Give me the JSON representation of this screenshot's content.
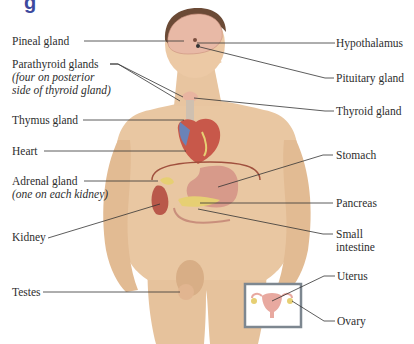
{
  "title_fragment": "g",
  "labels_left": [
    {
      "id": "pineal",
      "text": "Pineal gland",
      "note": ""
    },
    {
      "id": "parathyroid",
      "text": "Parathyroid glands",
      "note_line1": "(four on posterior",
      "note_line2": "side of thyroid gland)"
    },
    {
      "id": "thymus",
      "text": "Thymus gland",
      "note": ""
    },
    {
      "id": "heart",
      "text": "Heart",
      "note": ""
    },
    {
      "id": "adrenal",
      "text": "Adrenal gland",
      "note": "(one on each kidney)"
    },
    {
      "id": "kidney",
      "text": "Kidney",
      "note": ""
    },
    {
      "id": "testes",
      "text": "Testes",
      "note": ""
    }
  ],
  "labels_right": [
    {
      "id": "hypothalamus",
      "text": "Hypothalamus"
    },
    {
      "id": "pituitary",
      "text": "Pituitary gland"
    },
    {
      "id": "thyroid",
      "text": "Thyroid gland"
    },
    {
      "id": "stomach",
      "text": "Stomach"
    },
    {
      "id": "pancreas",
      "text": "Pancreas"
    },
    {
      "id": "small_intestine",
      "text_line1": "Small",
      "text_line2": "intestine"
    },
    {
      "id": "uterus",
      "text": "Uterus"
    },
    {
      "id": "ovary",
      "text": "Ovary"
    }
  ],
  "colors": {
    "skin": "#e9c7a2",
    "skin_shadow": "#d4a880",
    "hair": "#6b4a36",
    "brain": "#e8b9a6",
    "heart": "#c8584a",
    "vessel_blue": "#6a83b8",
    "stomach": "#d79a8a",
    "kidney": "#b9584a",
    "gland_yellow": "#e6cf73",
    "leader_line": "#333333",
    "inset_border": "#7d8790",
    "title": "#3d4a9e"
  }
}
